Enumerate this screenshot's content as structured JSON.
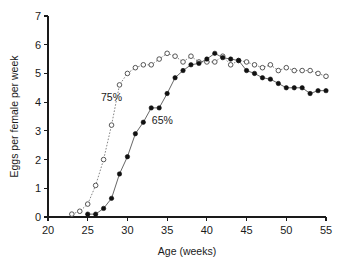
{
  "chart_data": {
    "type": "line",
    "title": "",
    "xlabel": "Age (weeks)",
    "ylabel": "Eggs per female per week",
    "xlim": [
      20,
      55
    ],
    "ylim": [
      0,
      7
    ],
    "xticks": [
      20,
      25,
      30,
      35,
      40,
      45,
      50,
      55
    ],
    "yticks": [
      0,
      1,
      2,
      3,
      4,
      5,
      6,
      7
    ],
    "grid": false,
    "legend_position": "inline-annotations",
    "annotations": [
      {
        "text": "75%",
        "x": 28.0,
        "y": 4.05
      },
      {
        "text": "65%",
        "x": 34.4,
        "y": 3.25
      }
    ],
    "series": [
      {
        "name": "75%",
        "marker": "open-circle",
        "linestyle": "dotted",
        "x": [
          23,
          24,
          25,
          26,
          27,
          28,
          29,
          30,
          31,
          32,
          33,
          34,
          35,
          36,
          37,
          38,
          39,
          40,
          41,
          42,
          43,
          44,
          45,
          46,
          47,
          48,
          49,
          50,
          51,
          52,
          53,
          54,
          55
        ],
        "values": [
          0.1,
          0.2,
          0.45,
          1.1,
          2.0,
          3.2,
          4.6,
          5.0,
          5.2,
          5.3,
          5.3,
          5.5,
          5.7,
          5.6,
          5.4,
          5.6,
          5.4,
          5.4,
          5.4,
          5.6,
          5.3,
          5.45,
          5.4,
          5.3,
          5.2,
          5.3,
          5.1,
          5.2,
          5.1,
          5.1,
          5.1,
          5.0,
          4.9
        ]
      },
      {
        "name": "65%",
        "marker": "filled-circle",
        "linestyle": "solid",
        "x": [
          25,
          26,
          27,
          28,
          29,
          30,
          31,
          32,
          33,
          34,
          35,
          36,
          37,
          38,
          39,
          40,
          41,
          42,
          43,
          44,
          45,
          46,
          47,
          48,
          49,
          50,
          51,
          52,
          53,
          54,
          55
        ],
        "values": [
          0.1,
          0.1,
          0.3,
          0.65,
          1.5,
          2.1,
          2.9,
          3.3,
          3.8,
          3.8,
          4.3,
          4.85,
          5.1,
          5.3,
          5.35,
          5.5,
          5.7,
          5.55,
          5.5,
          5.45,
          5.1,
          5.0,
          4.85,
          4.8,
          4.65,
          4.5,
          4.5,
          4.5,
          4.3,
          4.4,
          4.4
        ]
      }
    ]
  },
  "axes": {
    "x_tick_labels": [
      "20",
      "25",
      "30",
      "35",
      "40",
      "45",
      "50",
      "55"
    ],
    "y_tick_labels": [
      "0",
      "1",
      "2",
      "3",
      "4",
      "5",
      "6",
      "7"
    ]
  }
}
